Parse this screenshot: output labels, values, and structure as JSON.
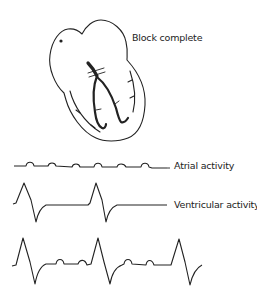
{
  "diagram": {
    "heart_label": "Block complete",
    "traces": [
      {
        "id": "atrial",
        "label": "Atrial activity"
      },
      {
        "id": "ventricular",
        "label": "Ventricular activity"
      },
      {
        "id": "combined",
        "label": ""
      }
    ]
  },
  "colors": {
    "stroke": "#222222",
    "background": "#ffffff"
  }
}
